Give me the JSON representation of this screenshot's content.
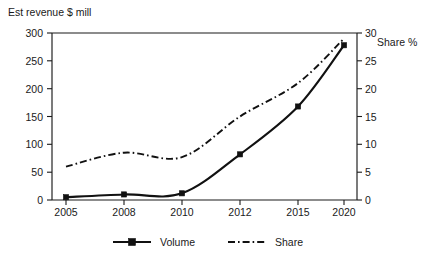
{
  "chart_data": {
    "type": "line",
    "title": "",
    "categories": [
      "2005",
      "2008",
      "2010",
      "2012",
      "2015",
      "2020"
    ],
    "x": [
      "2005",
      "2008",
      "2010",
      "2012",
      "2015",
      "2020"
    ],
    "xlabel": "",
    "ylabel": "Est revenue $ mill",
    "y2label": "Share %",
    "ylim": [
      0,
      300
    ],
    "y2lim": [
      0,
      30
    ],
    "yticks": [
      "0",
      "50",
      "100",
      "150",
      "200",
      "250",
      "300"
    ],
    "ytick_values": [
      0,
      50,
      100,
      150,
      200,
      250,
      300
    ],
    "y2ticks": [
      "0",
      "5",
      "10",
      "15",
      "20",
      "25",
      "30"
    ],
    "y2tick_values": [
      0,
      5,
      10,
      15,
      20,
      25,
      30
    ],
    "grid": false,
    "legend_position": "bottom",
    "series": [
      {
        "name": "Volume",
        "axis": "left",
        "style": "solid",
        "marker": "square",
        "values": [
          5,
          10,
          12,
          82,
          168,
          278
        ]
      },
      {
        "name": "Share",
        "axis": "right",
        "style": "dash-dot",
        "marker": "none",
        "values": [
          6,
          8.5,
          7.7,
          15,
          21,
          29
        ]
      }
    ]
  },
  "axes": {
    "left_title": "Est revenue $ mill",
    "right_title": "Share %"
  },
  "legend": {
    "items": [
      {
        "label": "Volume"
      },
      {
        "label": "Share"
      }
    ]
  },
  "ticks": {
    "x": [
      "2005",
      "2008",
      "2010",
      "2012",
      "2015",
      "2020"
    ],
    "left": [
      "300",
      "250",
      "200",
      "150",
      "100",
      "50",
      "0"
    ],
    "right": [
      "30",
      "25",
      "20",
      "15",
      "10",
      "5",
      "0"
    ]
  }
}
